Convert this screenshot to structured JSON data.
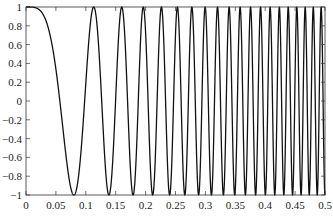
{
  "chart_data": {
    "type": "line",
    "title": "",
    "xlabel": "",
    "ylabel": "",
    "xlim": [
      0,
      0.5
    ],
    "ylim": [
      -1,
      1
    ],
    "grid": false,
    "legend": null,
    "x_ticks": [
      "0",
      "0.05",
      "0.1",
      "0.15",
      "0.2",
      "0.25",
      "0.3",
      "0.35",
      "0.4",
      "0.45",
      "0.5"
    ],
    "y_ticks": [
      "1",
      "0.8",
      "0.6",
      "0.4",
      "0.2",
      "0",
      "-0.2",
      "-0.4",
      "-0.6",
      "-0.8",
      "-1"
    ],
    "series": [
      {
        "name": "linear chirp",
        "function": "y = cos(pi * k * t^2)",
        "k": 156,
        "t_start": 0,
        "t_end": 0.5,
        "samples": 2000,
        "color": "#111111",
        "key_points": [
          {
            "t": 0.0,
            "y": 1
          },
          {
            "t": 0.08,
            "y": -1
          },
          {
            "t": 0.113,
            "y": 1
          },
          {
            "t": 0.139,
            "y": -1
          },
          {
            "t": 0.16,
            "y": 1
          },
          {
            "t": 0.179,
            "y": -1
          },
          {
            "t": 0.196,
            "y": 1
          },
          {
            "t": 0.5,
            "y": -1
          }
        ]
      }
    ]
  }
}
